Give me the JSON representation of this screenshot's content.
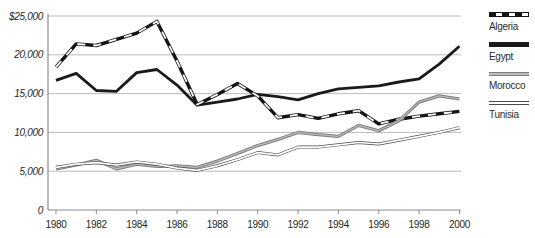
{
  "chart_data": {
    "type": "line",
    "title": "",
    "xlabel": "",
    "ylabel": "",
    "x": [
      1980,
      1981,
      1982,
      1983,
      1984,
      1985,
      1986,
      1987,
      1988,
      1989,
      1990,
      1991,
      1992,
      1993,
      1994,
      1995,
      1996,
      1997,
      1998,
      1999,
      2000
    ],
    "x_tick_years": [
      1980,
      1982,
      1984,
      1986,
      1988,
      1990,
      1992,
      1994,
      1996,
      1998,
      2000
    ],
    "x_tick_labels": [
      "1980",
      "1982",
      "1984",
      "1986",
      "1988",
      "1990",
      "1992",
      "1994",
      "1996",
      "1998",
      "2000"
    ],
    "y_ticks": [
      {
        "value": 25000,
        "label": "$25,000"
      },
      {
        "value": 20000,
        "label": "20,000"
      },
      {
        "value": 15000,
        "label": "15,000"
      },
      {
        "value": 10000,
        "label": "10,000"
      },
      {
        "value": 5000,
        "label": "5,000"
      },
      {
        "value": 0,
        "label": "0"
      }
    ],
    "ylim": [
      0,
      25000
    ],
    "grid": "horizontal",
    "legend_position": "right",
    "series": [
      {
        "name": "Algeria",
        "color": "#141414",
        "pattern": "thick-dashed",
        "values": [
          18400,
          21400,
          21200,
          22000,
          22800,
          24300,
          19200,
          13600,
          14900,
          16300,
          14700,
          11900,
          12300,
          11800,
          12400,
          12800,
          11100,
          11700,
          12100,
          12400,
          12700
        ]
      },
      {
        "name": "Egypt",
        "color": "#1a1a1a",
        "pattern": "thick-solid",
        "values": [
          16700,
          17600,
          15400,
          15300,
          17700,
          18100,
          16100,
          13500,
          13900,
          14300,
          14900,
          14600,
          14200,
          15000,
          15600,
          15800,
          16000,
          16500,
          16900,
          18800,
          21100
        ]
      },
      {
        "name": "Morocco",
        "color": "#7e7e7e",
        "pattern": "thick-gray-double",
        "values": [
          5300,
          5800,
          6400,
          5300,
          5900,
          5600,
          5700,
          5500,
          6300,
          7300,
          8300,
          9100,
          10000,
          9700,
          9500,
          10900,
          10200,
          11500,
          13900,
          14700,
          14300
        ]
      },
      {
        "name": "Tunisia",
        "color": "#4b4b4b",
        "pattern": "thin-double",
        "values": [
          5500,
          5900,
          6100,
          5800,
          6200,
          5900,
          5400,
          5100,
          5700,
          6500,
          7400,
          7100,
          8100,
          8100,
          8400,
          8700,
          8500,
          9000,
          9500,
          10000,
          10600
        ]
      }
    ],
    "colors": {
      "grid": "#a8a8a8",
      "axis": "#8c8c8c",
      "tick_text": "#1f1f1f",
      "background": "#ffffff"
    }
  }
}
